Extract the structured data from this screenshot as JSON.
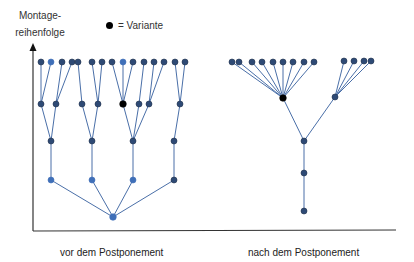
{
  "axis": {
    "y_label_line1": "Montage-",
    "y_label_line2": "reihenfolge"
  },
  "legend": {
    "symbol": "black-dot",
    "label": "= Variante"
  },
  "panels": [
    {
      "label": "vor dem Postponement"
    },
    {
      "label": "nach dem Postponement"
    }
  ],
  "colors": {
    "node_dark": "#2e4a75",
    "node_medium": "#3f6fb8",
    "node_variant": "#000000",
    "edge": "#4a6fa8",
    "axis": "#333333"
  },
  "trees": {
    "before": {
      "levels": 5,
      "top_row_count": 18,
      "variant_level": 2,
      "root": "bottom"
    },
    "after": {
      "levels": 5,
      "top_row_count": 13,
      "variant_level": 2,
      "root": "bottom"
    }
  }
}
